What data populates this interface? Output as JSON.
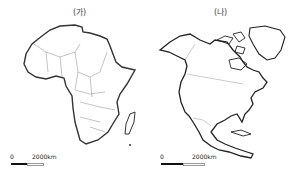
{
  "maps": [
    {
      "label": "(가)",
      "region": "Africa",
      "scale": {
        "zero": "0",
        "distance": "2000km"
      }
    },
    {
      "label": "(나)",
      "region": "North America",
      "scale": {
        "zero": "0",
        "distance": "2000km"
      }
    }
  ]
}
